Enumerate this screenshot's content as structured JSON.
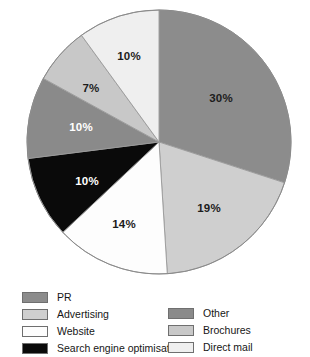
{
  "chart_data": {
    "type": "pie",
    "title": "",
    "subtitle": "",
    "xlabel": "",
    "ylabel": "",
    "legend_position": "bottom",
    "grid": false,
    "start_angle_deg": 0,
    "direction": "clockwise",
    "categories": [
      "PR",
      "Advertising",
      "Website",
      "Search engine optimisation",
      "Other",
      "Brochures",
      "Direct mail"
    ],
    "values": [
      30,
      19,
      14,
      10,
      10,
      7,
      10
    ],
    "value_labels": [
      "30%",
      "19%",
      "14%",
      "10%",
      "10%",
      "7%",
      "10%"
    ],
    "colors": [
      "#8c8c8c",
      "#cfcfcf",
      "#fdfdfd",
      "#0a0a0a",
      "#8a8a8a",
      "#c8c8c8",
      "#efefef"
    ],
    "slices": [
      {
        "name": "PR",
        "value": 30,
        "label": "30%",
        "color": "#8c8c8c",
        "label_color": "#1c1c1c",
        "label_x": 221,
        "label_y": 99
      },
      {
        "name": "Advertising",
        "value": 19,
        "label": "19%",
        "color": "#cfcfcf",
        "label_color": "#1c1c1c",
        "label_x": 209,
        "label_y": 209
      },
      {
        "name": "Website",
        "value": 14,
        "label": "14%",
        "color": "#fdfdfd",
        "label_color": "#1c1c1c",
        "label_x": 124,
        "label_y": 225
      },
      {
        "name": "Search engine optimisation",
        "value": 10,
        "label": "10%",
        "color": "#0a0a0a",
        "label_color": "#ffffff",
        "label_x": 87,
        "label_y": 182
      },
      {
        "name": "Other",
        "value": 10,
        "label": "10%",
        "color": "#8a8a8a",
        "label_color": "#ffffff",
        "label_x": 81,
        "label_y": 128
      },
      {
        "name": "Brochures",
        "value": 7,
        "label": "7%",
        "color": "#c8c8c8",
        "label_color": "#1c1c1c",
        "label_x": 91,
        "label_y": 89
      },
      {
        "name": "Direct mail",
        "value": 10,
        "label": "10%",
        "color": "#efefef",
        "label_color": "#1c1c1c",
        "label_x": 129,
        "label_y": 57
      }
    ],
    "geometry": {
      "cx": 159,
      "cy": 142,
      "r": 132
    }
  },
  "legend": {
    "columns": [
      {
        "items": [
          {
            "label": "PR",
            "color": "#8c8c8c"
          },
          {
            "label": "Advertising",
            "color": "#cfcfcf"
          },
          {
            "label": "Website",
            "color": "#fdfdfd"
          },
          {
            "label": "Search engine optimisation",
            "color": "#0a0a0a"
          }
        ]
      },
      {
        "items": [
          {
            "label": "Other",
            "color": "#8a8a8a"
          },
          {
            "label": "Brochures",
            "color": "#c8c8c8"
          },
          {
            "label": "Direct mail",
            "color": "#efefef"
          }
        ]
      }
    ]
  }
}
